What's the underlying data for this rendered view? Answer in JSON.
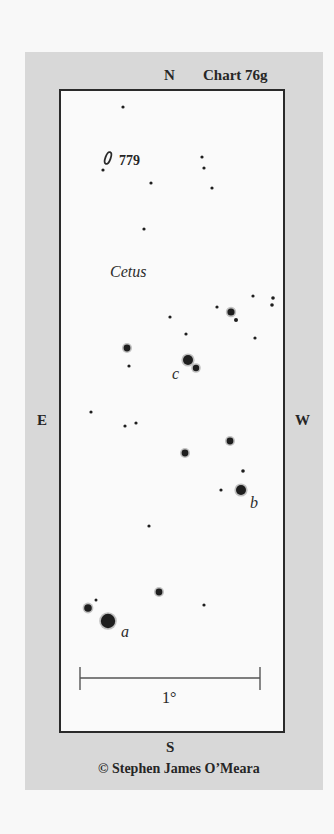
{
  "chart": {
    "title": "Chart 76g",
    "constellation": "Cetus",
    "object_label": "779",
    "directions": {
      "north": "N",
      "south": "S",
      "east": "E",
      "west": "W"
    },
    "scale_label": "1°",
    "credit": "© Stephen James O’Meara",
    "star_labels": {
      "a": "a",
      "b": "b",
      "c": "c"
    },
    "colors": {
      "panel": "#d8d8d8",
      "field": "#fafafa",
      "ink": "#262626"
    }
  },
  "stars": [
    {
      "x": 123,
      "y": 107,
      "r": 1.6
    },
    {
      "x": 103,
      "y": 170,
      "r": 1.6
    },
    {
      "x": 151,
      "y": 183,
      "r": 1.6
    },
    {
      "x": 202,
      "y": 157,
      "r": 1.6
    },
    {
      "x": 204,
      "y": 168,
      "r": 1.6
    },
    {
      "x": 212,
      "y": 188,
      "r": 1.6
    },
    {
      "x": 144,
      "y": 229,
      "r": 1.6
    },
    {
      "x": 253,
      "y": 296,
      "r": 1.6
    },
    {
      "x": 273,
      "y": 298,
      "r": 1.8
    },
    {
      "x": 272,
      "y": 305,
      "r": 1.8
    },
    {
      "x": 217,
      "y": 307,
      "r": 1.6
    },
    {
      "x": 231,
      "y": 312,
      "r": 3.6
    },
    {
      "x": 236,
      "y": 320,
      "r": 2
    },
    {
      "x": 170,
      "y": 317,
      "r": 1.6
    },
    {
      "x": 186,
      "y": 334,
      "r": 1.6
    },
    {
      "x": 255,
      "y": 338,
      "r": 1.6
    },
    {
      "x": 127,
      "y": 348,
      "r": 3.4
    },
    {
      "x": 129,
      "y": 366,
      "r": 1.6
    },
    {
      "x": 188,
      "y": 360,
      "r": 5
    },
    {
      "x": 196,
      "y": 368,
      "r": 3.2
    },
    {
      "x": 91,
      "y": 412,
      "r": 1.6
    },
    {
      "x": 125,
      "y": 426,
      "r": 1.6
    },
    {
      "x": 136,
      "y": 423,
      "r": 1.6
    },
    {
      "x": 230,
      "y": 441,
      "r": 3.4
    },
    {
      "x": 185,
      "y": 453,
      "r": 3.4
    },
    {
      "x": 243,
      "y": 471,
      "r": 1.8
    },
    {
      "x": 221,
      "y": 490,
      "r": 1.6
    },
    {
      "x": 241,
      "y": 490,
      "r": 5
    },
    {
      "x": 149,
      "y": 526,
      "r": 1.6
    },
    {
      "x": 159,
      "y": 592,
      "r": 3.4
    },
    {
      "x": 204,
      "y": 605,
      "r": 1.6
    },
    {
      "x": 88,
      "y": 608,
      "r": 3.8
    },
    {
      "x": 96,
      "y": 600,
      "r": 1.5
    },
    {
      "x": 108,
      "y": 621,
      "r": 7.2
    }
  ]
}
